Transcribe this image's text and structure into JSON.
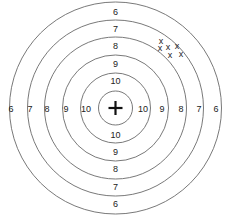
{
  "target": {
    "center": {
      "x": 115.5,
      "y": 108
    },
    "rings": [
      {
        "score": "6",
        "radius": 106
      },
      {
        "score": "7",
        "radius": 88
      },
      {
        "score": "8",
        "radius": 71
      },
      {
        "score": "9",
        "radius": 53
      },
      {
        "score": "10",
        "radius": 35
      },
      {
        "score": "bull",
        "radius": 17
      }
    ],
    "labels": {
      "top": [
        "6",
        "7",
        "8",
        "9",
        "10"
      ],
      "bottom": [
        "10",
        "9",
        "8",
        "7",
        "6"
      ],
      "left": [
        "6",
        "7",
        "8",
        "9",
        "10"
      ],
      "right": [
        "10",
        "9",
        "8",
        "7",
        "6"
      ]
    },
    "center_symbol": "+",
    "shots": [
      {
        "label": "x",
        "x": 161,
        "y": 41
      },
      {
        "label": "x",
        "x": 160,
        "y": 48
      },
      {
        "label": "x",
        "x": 168,
        "y": 47
      },
      {
        "label": "x",
        "x": 177,
        "y": 46
      },
      {
        "label": "x",
        "x": 170,
        "y": 55
      },
      {
        "label": "x",
        "x": 181,
        "y": 54
      }
    ],
    "ring_color": "#6a6a6a",
    "text_color": "#222222"
  }
}
